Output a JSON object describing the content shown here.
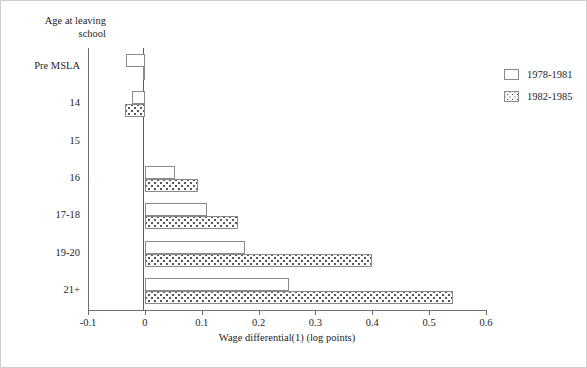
{
  "chart_data": {
    "type": "bar",
    "orientation": "horizontal",
    "title": "",
    "xlabel": "Wage differential(1) (log points)",
    "ylabel": "Age at leaving school",
    "categories": [
      "Pre MSLA",
      "14",
      "15",
      "16",
      "17-18",
      "19-20",
      "21+"
    ],
    "series": [
      {
        "name": "1978-1981",
        "values": [
          -0.033,
          -0.022,
          0.0,
          0.053,
          0.109,
          0.176,
          0.254
        ]
      },
      {
        "name": "1982-1985",
        "values": [
          -0.004,
          -0.035,
          0.0,
          0.093,
          0.164,
          0.4,
          0.542
        ]
      }
    ],
    "xlim": [
      -0.1,
      0.6
    ],
    "xticks": [
      -0.1,
      0,
      0.1,
      0.2,
      0.3,
      0.4,
      0.5,
      0.6
    ],
    "xtick_labels": [
      "-0.1",
      "0",
      "0.1",
      "0.2",
      "0.3",
      "0.4",
      "0.5",
      "0.6"
    ],
    "grid": false,
    "legend_position": "right"
  },
  "axes": {
    "y_title": "Age at leaving\nschool",
    "x_title": "Wage differential(1) (log points)"
  },
  "legend": {
    "entries": [
      {
        "label": "1978-1981",
        "pattern": "empty"
      },
      {
        "label": "1982-1985",
        "pattern": "dotted"
      }
    ]
  },
  "colors": {
    "series_1978_1981_fill": "#ffffff",
    "series_1982_1985_fill": "#fbfbfb",
    "bar_border": "#8a8a8a",
    "axis": "#6f6f6f",
    "text": "#1e1e1e"
  }
}
